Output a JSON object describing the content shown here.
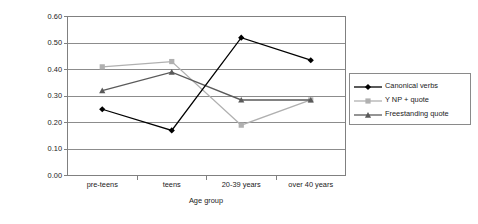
{
  "chart_data": {
    "type": "line",
    "title": "",
    "xlabel": "Age group",
    "ylabel": "Probability weighting",
    "categories": [
      "pre-teens",
      "teens",
      "20-39 years",
      "over 40 years"
    ],
    "ylim": [
      0.0,
      0.6
    ],
    "ytick_labels": [
      "0.00",
      "0.10",
      "0.20",
      "0.30",
      "0.40",
      "0.50",
      "0.60"
    ],
    "ytick_values": [
      0.0,
      0.1,
      0.2,
      0.3,
      0.4,
      0.5,
      0.6
    ],
    "grid": "horizontal",
    "legend_position": "right",
    "series": [
      {
        "name": "Canonical verbs",
        "marker": "diamond",
        "color": "#000000",
        "values": [
          0.25,
          0.17,
          0.52,
          0.435
        ]
      },
      {
        "name": "Y NP + quote",
        "marker": "square",
        "color": "#b0b0b0",
        "values": [
          0.41,
          0.43,
          0.19,
          0.285
        ]
      },
      {
        "name": "Freestanding quote",
        "marker": "triangle",
        "color": "#5a5a5a",
        "values": [
          0.32,
          0.39,
          0.285,
          0.285
        ]
      }
    ]
  },
  "axes": {
    "frame_color": "#808080",
    "grid_color": "#8c8c8c"
  }
}
